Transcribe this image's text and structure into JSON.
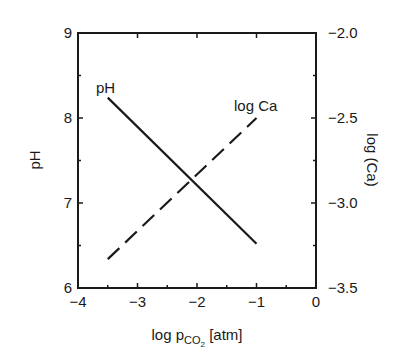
{
  "chart_data": {
    "type": "line",
    "title": "",
    "xlabel": "log p",
    "xlabel_subscript": "CO",
    "xlabel_subscript2": "2",
    "xlabel_unit": " [atm]",
    "ylabel": "pH",
    "y2label": "log (Ca)",
    "xlim": [
      -4,
      0
    ],
    "ylim": [
      6,
      9
    ],
    "y2lim": [
      -3.5,
      -2.0
    ],
    "grid": false,
    "legend": "inline labels",
    "x_ticks": [
      -4,
      -3,
      -2,
      -1,
      0
    ],
    "x_tick_labels": [
      "−4",
      "−3",
      "−2",
      "−1",
      "0"
    ],
    "y_ticks": [
      6,
      7,
      8,
      9
    ],
    "y_tick_labels": [
      "6",
      "7",
      "8",
      "9"
    ],
    "y2_ticks": [
      -3.5,
      -3.0,
      -2.5,
      -2.0
    ],
    "y2_tick_labels": [
      "−3.5",
      "−3.0",
      "−2.5",
      "−2.0"
    ],
    "series": [
      {
        "name": "pH",
        "axis": "left",
        "style": "solid",
        "x": [
          -3.5,
          -1.0
        ],
        "values": [
          8.24,
          6.52
        ]
      },
      {
        "name": "log Ca",
        "axis": "right",
        "style": "dashed",
        "x": [
          -3.5,
          -1.0
        ],
        "values": [
          -3.33,
          -2.5
        ]
      }
    ],
    "annotations": [
      {
        "text": "pH",
        "near_series": "pH"
      },
      {
        "text": "log Ca",
        "near_series": "log Ca"
      }
    ]
  }
}
